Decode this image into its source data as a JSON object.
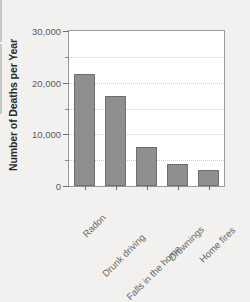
{
  "chart_data": {
    "type": "bar",
    "title": "",
    "subtitle": "",
    "xlabel": "",
    "ylabel": "Number of Deaths per Year",
    "categories": [
      "Radon",
      "Drunk driving",
      "Falls in the home",
      "Drownings",
      "Home fires"
    ],
    "values": [
      21700,
      17400,
      7500,
      4300,
      3100
    ],
    "series": [
      {
        "name": "Number of Deaths per Year",
        "values": [
          21700,
          17400,
          7500,
          4300,
          3100
        ]
      }
    ],
    "ylim": [
      0,
      30000
    ],
    "ytick_labels": [
      "0",
      "10,000",
      "20,000",
      "30,000"
    ],
    "ytick_values": [
      0,
      10000,
      20000,
      30000
    ],
    "yminor_tick_values": [
      5000,
      15000,
      25000
    ],
    "grid": true,
    "grid_axis": "y",
    "grid_values": [
      5000,
      10000,
      15000,
      20000,
      25000
    ],
    "legend": false,
    "legend_position": "none",
    "bar_color": "#8f8f8f",
    "bar_edge_color": "#6f6f6f",
    "plot_background": "#ffffff",
    "figure_background": "#f2f1ef",
    "axis_color": "#9b9a98",
    "tick_label_color": "#5d5c5a",
    "xlabel_rotation": -45,
    "annotations": []
  }
}
